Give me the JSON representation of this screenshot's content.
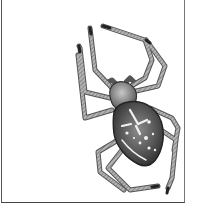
{
  "image": {
    "subject": "garden orb-weaver spider illustration",
    "style": "grayscale engraving",
    "colors": {
      "background": "#ffffff",
      "frame": "#555555",
      "body_dark": "#3a3a3a",
      "body_mid": "#6e6e6e",
      "leg": "#8a8a8a",
      "marking": "#f2f2f2"
    }
  }
}
